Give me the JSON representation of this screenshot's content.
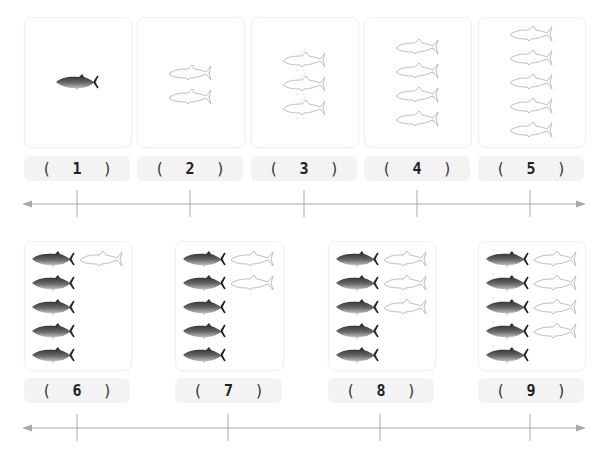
{
  "rows": [
    {
      "cards": [
        {
          "filled": 1,
          "outline": 0,
          "layout": "single"
        },
        {
          "filled": 0,
          "outline": 2,
          "layout": "column"
        },
        {
          "filled": 0,
          "outline": 3,
          "layout": "column"
        },
        {
          "filled": 0,
          "outline": 4,
          "layout": "column"
        },
        {
          "filled": 0,
          "outline": 5,
          "layout": "column"
        }
      ],
      "labels": [
        {
          "open": "(",
          "value": "1",
          "close": ")"
        },
        {
          "open": "(",
          "value": "2",
          "close": ")"
        },
        {
          "open": "(",
          "value": "3",
          "close": ")"
        },
        {
          "open": "(",
          "value": "4",
          "close": ")"
        },
        {
          "open": "(",
          "value": "5",
          "close": ")"
        }
      ]
    },
    {
      "cards": [
        {
          "filled": 5,
          "outline": 1,
          "layout": "grid"
        },
        {
          "filled": 5,
          "outline": 2,
          "layout": "grid"
        },
        {
          "filled": 5,
          "outline": 3,
          "layout": "grid"
        },
        {
          "filled": 5,
          "outline": 4,
          "layout": "grid"
        }
      ],
      "labels": [
        {
          "open": "(",
          "value": "6",
          "close": ")"
        },
        {
          "open": "(",
          "value": "7",
          "close": ")"
        },
        {
          "open": "(",
          "value": "8",
          "close": ")"
        },
        {
          "open": "(",
          "value": "9",
          "close": ")"
        }
      ]
    }
  ],
  "colors": {
    "axis": "#a9a9a9",
    "card_border": "#f1f1f1",
    "label_bg": "#f3f3f3",
    "fish_outline": "#b5b5b5",
    "fish_dark": "#3a3a3a"
  }
}
